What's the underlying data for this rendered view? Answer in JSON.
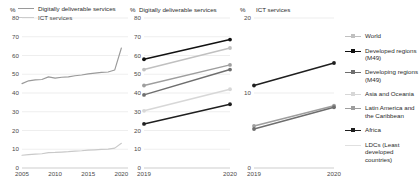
{
  "figure": {
    "width": 420,
    "height": 190,
    "background": "#ffffff"
  },
  "panels": {
    "left": {
      "title": "",
      "axis_unit": "%",
      "yticks": [
        "0",
        "10",
        "20",
        "30",
        "40",
        "50",
        "60",
        "70",
        "80"
      ],
      "xticks": [
        "2005",
        "2010",
        "2015",
        "2020"
      ],
      "legend": [
        {
          "label": "Digitally deliverable services",
          "color": "#9a9a9a"
        },
        {
          "label": "ICT services",
          "color": "#c9c9c9"
        }
      ]
    },
    "mid": {
      "title": "Digitally deliverable services",
      "axis_unit": "%",
      "yticks": [
        "0",
        "10",
        "20",
        "30",
        "40",
        "50",
        "60",
        "70",
        "80"
      ],
      "xticks": [
        "2019",
        "2020"
      ]
    },
    "right": {
      "title": "ICT services",
      "axis_unit": "%",
      "yticks": [
        "0",
        "10",
        "20"
      ],
      "xticks": [
        "2019",
        "2020"
      ]
    }
  },
  "legend_right": {
    "items": [
      {
        "label": "World",
        "color": "#c0c0c0",
        "marker": true
      },
      {
        "label": "Developed regions (M49)",
        "color": "#111111",
        "marker": true
      },
      {
        "label": "Developing regions (M49)",
        "color": "#6e6e6e",
        "marker": true
      },
      {
        "label": "Asia and Oceania",
        "color": "#d7d7d7",
        "marker": true
      },
      {
        "label": "Latin America and the Caribbean",
        "color": "#9e9e9e",
        "marker": true
      },
      {
        "label": "Africa",
        "color": "#1f1f1f",
        "marker": true
      },
      {
        "label": "LDCs (Least developed countries)",
        "color": "#e0e0e0",
        "marker": false
      }
    ]
  },
  "chart_data": [
    {
      "type": "line",
      "id": "left-timeseries",
      "title": "",
      "xlabel": "",
      "ylabel": "%",
      "xlim": [
        2005,
        2021
      ],
      "ylim": [
        0,
        80
      ],
      "grid": true,
      "legend_position": "top-left",
      "x": [
        2005,
        2006,
        2007,
        2008,
        2009,
        2010,
        2011,
        2012,
        2013,
        2014,
        2015,
        2016,
        2017,
        2018,
        2019,
        2020
      ],
      "series": [
        {
          "name": "Digitally deliverable services",
          "color": "#9a9a9a",
          "values": [
            45.0,
            46.5,
            47.0,
            47.2,
            48.6,
            47.9,
            48.4,
            48.6,
            49.2,
            49.6,
            50.2,
            50.6,
            51.0,
            51.2,
            52.3,
            64.0
          ]
        },
        {
          "name": "ICT services",
          "color": "#c9c9c9",
          "values": [
            6.8,
            7.1,
            7.4,
            7.6,
            8.2,
            8.3,
            8.5,
            8.7,
            9.0,
            9.2,
            9.5,
            9.7,
            9.9,
            10.1,
            10.6,
            13.2
          ]
        }
      ]
    },
    {
      "type": "line",
      "id": "mid-digitally-deliverable",
      "title": "Digitally deliverable services",
      "xlabel": "",
      "ylabel": "%",
      "xlim": [
        2019,
        2020
      ],
      "ylim": [
        0,
        80
      ],
      "grid": true,
      "categories": [
        "2019",
        "2020"
      ],
      "series": [
        {
          "name": "Developed regions (M49)",
          "color": "#111111",
          "values": [
            58.0,
            68.5
          ],
          "marker": true
        },
        {
          "name": "World",
          "color": "#c0c0c0",
          "values": [
            52.5,
            64.0
          ],
          "marker": true
        },
        {
          "name": "Latin America and the Caribbean",
          "color": "#9e9e9e",
          "values": [
            44.0,
            55.0
          ],
          "marker": true
        },
        {
          "name": "Developing regions (M49)",
          "color": "#6e6e6e",
          "values": [
            39.0,
            52.5
          ],
          "marker": true
        },
        {
          "name": "Asia and Oceania",
          "color": "#d7d7d7",
          "values": [
            30.5,
            42.0
          ],
          "marker": true
        },
        {
          "name": "Africa",
          "color": "#1f1f1f",
          "values": [
            23.5,
            34.0
          ],
          "marker": true
        }
      ]
    },
    {
      "type": "line",
      "id": "right-ict-services",
      "title": "ICT services",
      "xlabel": "",
      "ylabel": "%",
      "xlim": [
        2019,
        2020
      ],
      "ylim": [
        0,
        20
      ],
      "grid": true,
      "categories": [
        "2019",
        "2020"
      ],
      "series": [
        {
          "name": "Developed regions (M49)",
          "color": "#1f1f1f",
          "values": [
            11.0,
            14.0
          ],
          "marker": true
        },
        {
          "name": "World",
          "color": "#9e9e9e",
          "values": [
            5.6,
            8.3
          ],
          "marker": true
        },
        {
          "name": "Developing regions (M49)",
          "color": "#6e6e6e",
          "values": [
            5.2,
            8.1
          ],
          "marker": true
        }
      ]
    }
  ]
}
